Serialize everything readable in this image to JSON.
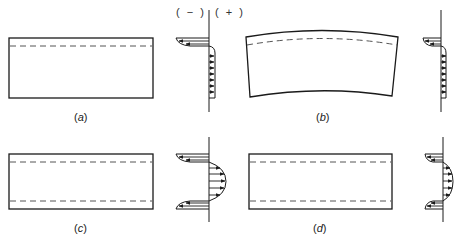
{
  "figure": {
    "sign_labels": {
      "negative": "( − )",
      "positive": "( + )"
    },
    "panels": [
      {
        "id": "a",
        "label_open": "(",
        "label_letter": "a",
        "label_close": ")",
        "shape": "rectangle",
        "dashed_lines": [
          "top"
        ],
        "stress_profile": "compressive skin at top, uniform tension below"
      },
      {
        "id": "b",
        "label_open": "(",
        "label_letter": "b",
        "label_close": ")",
        "shape": "curved (bowed) rectangle",
        "dashed_lines": [
          "top (curved)"
        ],
        "stress_profile": "compressive skin at top, uniform tension below"
      },
      {
        "id": "c",
        "label_open": "(",
        "label_letter": "c",
        "label_close": ")",
        "shape": "rectangle",
        "dashed_lines": [
          "top",
          "bottom"
        ],
        "stress_profile": "compressive skins at top and bottom, parabolic tension in core"
      },
      {
        "id": "d",
        "label_open": "(",
        "label_letter": "d",
        "label_close": ")",
        "shape": "rectangle",
        "dashed_lines": [
          "top",
          "bottom"
        ],
        "stress_profile": "thinner compressive skins at top and bottom, parabolic tension in core"
      }
    ],
    "colors": {
      "line": "#1a1a1a",
      "dash": "#555555",
      "background": "#ffffff"
    }
  }
}
